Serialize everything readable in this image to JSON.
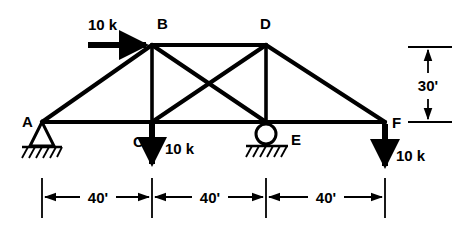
{
  "figure": {
    "type": "truss-free-body-diagram",
    "title": "",
    "stroke_color": "#000000",
    "background_color": "#ffffff"
  },
  "nodes": [
    {
      "id": "A",
      "label": "A",
      "x": 42,
      "y": 122,
      "support": "pin",
      "label_x": 22,
      "label_y": 126
    },
    {
      "id": "B",
      "label": "B",
      "x": 152,
      "y": 45,
      "support": "none",
      "label_x": 157,
      "label_y": 28
    },
    {
      "id": "C",
      "label": "C",
      "x": 152,
      "y": 122,
      "support": "none",
      "label_x": 133,
      "label_y": 146
    },
    {
      "id": "D",
      "label": "D",
      "x": 266,
      "y": 45,
      "support": "none",
      "label_x": 262,
      "label_y": 28
    },
    {
      "id": "E",
      "label": "E",
      "x": 266,
      "y": 122,
      "support": "roller",
      "label_x": 290,
      "label_y": 143
    },
    {
      "id": "F",
      "label": "F",
      "x": 385,
      "y": 122,
      "support": "none",
      "label_x": 392,
      "label_y": 127
    }
  ],
  "members": [
    {
      "from": "A",
      "to": "B",
      "name": "top-chord-left"
    },
    {
      "from": "B",
      "to": "D",
      "name": "top-chord-center"
    },
    {
      "from": "D",
      "to": "F",
      "name": "top-chord-right"
    },
    {
      "from": "A",
      "to": "F",
      "name": "bottom-chord"
    },
    {
      "from": "B",
      "to": "C",
      "name": "vertical-bc"
    },
    {
      "from": "D",
      "to": "E",
      "name": "vertical-de"
    },
    {
      "from": "B",
      "to": "E",
      "name": "diagonal-be"
    },
    {
      "from": "C",
      "to": "D",
      "name": "diagonal-cd"
    }
  ],
  "loads": [
    {
      "id": "load-b",
      "at": "B",
      "label": "10 k",
      "direction": "right",
      "label_x": 88,
      "label_y": 24,
      "arrow_from_x": 88,
      "arrow_from_y": 45,
      "arrow_to_x": 150,
      "arrow_to_y": 45
    },
    {
      "id": "load-c",
      "at": "C",
      "label": "10 k",
      "direction": "down",
      "label_x": 165,
      "label_y": 153,
      "arrow_from_x": 152,
      "arrow_from_y": 123,
      "arrow_to_x": 152,
      "arrow_to_y": 170
    },
    {
      "id": "load-f",
      "at": "F",
      "label": "10 k",
      "direction": "down",
      "label_x": 398,
      "label_y": 160,
      "arrow_from_x": 385,
      "arrow_from_y": 123,
      "arrow_to_x": 385,
      "arrow_to_y": 172
    }
  ],
  "dimensions": {
    "horizontal": {
      "line_y": 197,
      "extension_top_y": 178,
      "extension_bottom_y": 218,
      "bays": [
        {
          "label": "40'",
          "x_start": 42,
          "x_end": 152,
          "label_x": 97,
          "label_y": 202
        },
        {
          "label": "40'",
          "x_start": 152,
          "x_end": 266,
          "label_x": 209,
          "label_y": 202
        },
        {
          "label": "40'",
          "x_start": 266,
          "x_end": 385,
          "label_x": 325,
          "label_y": 202
        }
      ]
    },
    "vertical": {
      "label": "30'",
      "x": 428,
      "y_top": 47,
      "y_bottom": 122,
      "tick_x_start": 408,
      "tick_x_end": 452,
      "label_x": 428,
      "label_y": 90
    }
  },
  "supports": {
    "pin": {
      "node": "A",
      "type_label": "pin"
    },
    "roller": {
      "node": "E",
      "type_label": "roller"
    }
  }
}
